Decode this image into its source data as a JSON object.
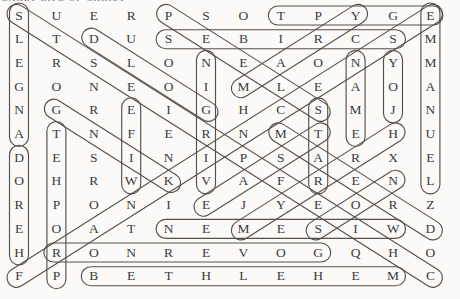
{
  "page": {
    "title_fragment": "EARLY LIFE OF CHRIST",
    "background": "#fbfaf8",
    "ink_color": "#3b3b3b",
    "capsule_color": "#555149"
  },
  "puzzle": {
    "rows": 12,
    "cols": 12,
    "grid": [
      "SUERPSOTPYGE",
      "LTDUSEBIRCSM",
      "ERSLONEAONYM",
      "GONEOIMLEAOA",
      "NGREIGHCSMJN",
      "ATNFERNMTEHU",
      "DESINIPSARXE",
      "OHRWKVAFRENL",
      "RPONIEJYEORZ",
      "EOATNEMESIWD",
      "HRONREVOGQHO",
      "FPBETHLEHEMC"
    ],
    "circled_words": [
      {
        "word": "ANGELS",
        "start": [
          6,
          1
        ],
        "end": [
          1,
          1
        ]
      },
      {
        "word": "HEROD",
        "start": [
          11,
          1
        ],
        "end": [
          7,
          1
        ]
      },
      {
        "word": "PROPHET",
        "start": [
          12,
          2
        ],
        "end": [
          6,
          2
        ]
      },
      {
        "word": "WIFE",
        "start": [
          8,
          4
        ],
        "end": [
          5,
          4
        ]
      },
      {
        "word": "VIRGIN",
        "start": [
          8,
          6
        ],
        "end": [
          3,
          6
        ]
      },
      {
        "word": "GOLD",
        "start": [
          5,
          6
        ],
        "end": [
          2,
          3
        ]
      },
      {
        "word": "KING",
        "start": [
          8,
          5
        ],
        "end": [
          5,
          2
        ]
      },
      {
        "word": "CHIEFPRIESTS",
        "start": [
          12,
          12
        ],
        "end": [
          1,
          1
        ]
      },
      {
        "word": "FRANKINCENSE",
        "start": [
          12,
          1
        ],
        "end": [
          1,
          12
        ]
      },
      {
        "word": "EGYPT",
        "start": [
          1,
          12
        ],
        "end": [
          1,
          8
        ]
      },
      {
        "word": "SCRIBES",
        "start": [
          2,
          11
        ],
        "end": [
          2,
          5
        ]
      },
      {
        "word": "SLEEP",
        "start": [
          5,
          9
        ],
        "end": [
          1,
          5
        ]
      },
      {
        "word": "EMMANUEL",
        "start": [
          1,
          12
        ],
        "end": [
          8,
          12
        ]
      },
      {
        "word": "MARY",
        "start": [
          4,
          7
        ],
        "end": [
          1,
          10
        ]
      },
      {
        "word": "NAME",
        "start": [
          3,
          10
        ],
        "end": [
          6,
          10
        ]
      },
      {
        "word": "JOY",
        "start": [
          5,
          11
        ],
        "end": [
          3,
          11
        ]
      },
      {
        "word": "STAR",
        "start": [
          5,
          9
        ],
        "end": [
          8,
          9
        ]
      },
      {
        "word": "DREAM",
        "start": [
          10,
          12
        ],
        "end": [
          6,
          8
        ]
      },
      {
        "word": "EAST",
        "start": [
          9,
          6
        ],
        "end": [
          6,
          9
        ]
      },
      {
        "word": "MYRRH",
        "start": [
          10,
          7
        ],
        "end": [
          6,
          11
        ]
      },
      {
        "word": "SON",
        "start": [
          10,
          9
        ],
        "end": [
          8,
          11
        ]
      },
      {
        "word": "WISEMEN",
        "start": [
          10,
          11
        ],
        "end": [
          10,
          5
        ]
      },
      {
        "word": "GOVERNOR",
        "start": [
          11,
          9
        ],
        "end": [
          11,
          2
        ]
      },
      {
        "word": "BETHLEHEM",
        "start": [
          12,
          3
        ],
        "end": [
          12,
          11
        ]
      }
    ]
  }
}
